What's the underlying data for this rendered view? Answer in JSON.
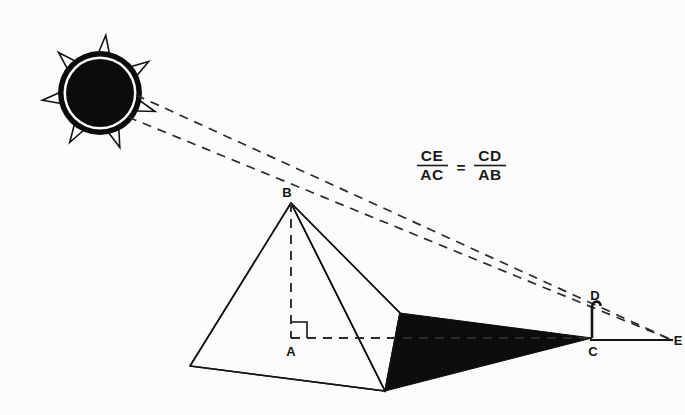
{
  "figure": {
    "background_color": "#fbfbfb",
    "ink_color": "#141414"
  },
  "formula": {
    "numerator_left": "CE",
    "denominator_left": "AC",
    "equals": "=",
    "numerator_right": "CD",
    "denominator_right": "AB"
  },
  "labels": {
    "a": "A",
    "b": "B",
    "c": "C",
    "d": "D",
    "e": "E"
  },
  "points": {
    "A": {
      "x": 291,
      "y": 338
    },
    "B": {
      "x": 291,
      "y": 203
    },
    "C": {
      "x": 592,
      "y": 338
    },
    "D": {
      "x": 592,
      "y": 303
    },
    "E": {
      "x": 672,
      "y": 340
    }
  },
  "sun": {
    "name": "sun",
    "center_x": 100,
    "center_y": 93,
    "star_points": 7,
    "star_outer_radius": 58,
    "star_inner_radius": 25,
    "disc_radius": 34,
    "ring_radius": 42
  },
  "rays": [
    {
      "name": "ray-through-apex-B",
      "from_x": 128,
      "from_y": 117,
      "to_x": 672,
      "to_y": 340
    },
    {
      "name": "ray-through-staff-top-D",
      "from_x": 133,
      "from_y": 98,
      "to_x": 672,
      "to_y": 340
    }
  ],
  "pyramid": {
    "apex_x": 291,
    "apex_y": 203,
    "base_left_x": 190,
    "base_left_y": 366,
    "base_front_x": 385,
    "base_front_y": 391,
    "base_right_x": 400,
    "base_right_y": 313
  },
  "shadow": {
    "name": "pyramid-shadow",
    "tip_x": 592,
    "tip_y": 338
  },
  "staff": {
    "name": "measuring-staff",
    "base_x": 592,
    "base_y": 338,
    "top_x": 592,
    "top_y": 303,
    "has_hook": true
  },
  "ground": {
    "from_x": 592,
    "from_y": 340,
    "to_x": 672,
    "to_y": 340
  },
  "axis_line": {
    "name": "horizontal-base-axis",
    "from_x": 291,
    "from_y": 338,
    "to_x": 592,
    "to_y": 338
  },
  "height_line": {
    "name": "pyramid-height-AB",
    "from_x": 291,
    "from_y": 203,
    "to_x": 291,
    "to_y": 338
  }
}
